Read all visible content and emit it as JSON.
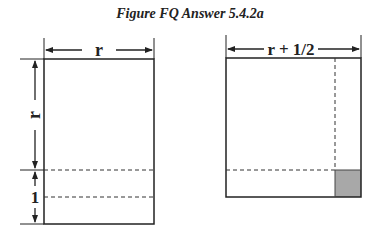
{
  "title": "Figure FQ Answer 5.4.2a",
  "left_figure": {
    "width_label": "r",
    "height_label": "r",
    "extension_label": "1"
  },
  "right_figure": {
    "width_label": "r + 1/2"
  },
  "colors": {
    "stroke": "#222222",
    "shaded": "#a8a8a8"
  }
}
